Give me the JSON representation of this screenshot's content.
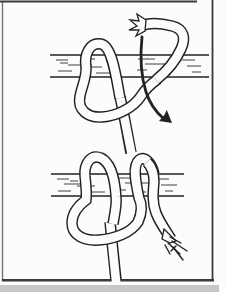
{
  "colors": {
    "ink": "#222222",
    "paper": "#fcfcfb",
    "border": "#3a3a3a",
    "page_edge": "#c8c8c4"
  },
  "figure": {
    "panels": [
      {
        "name": "step-1",
        "description": "rope wrapped once over the rail, frayed working end at top, curved arrow showing downward pass"
      },
      {
        "name": "step-2",
        "description": "completed hitch with two turns over the rail, large lower loop, frayed end pointing down-right, standing part hanging down"
      }
    ],
    "icons": {
      "arrow": "curved-downward-motion-arrow"
    }
  }
}
